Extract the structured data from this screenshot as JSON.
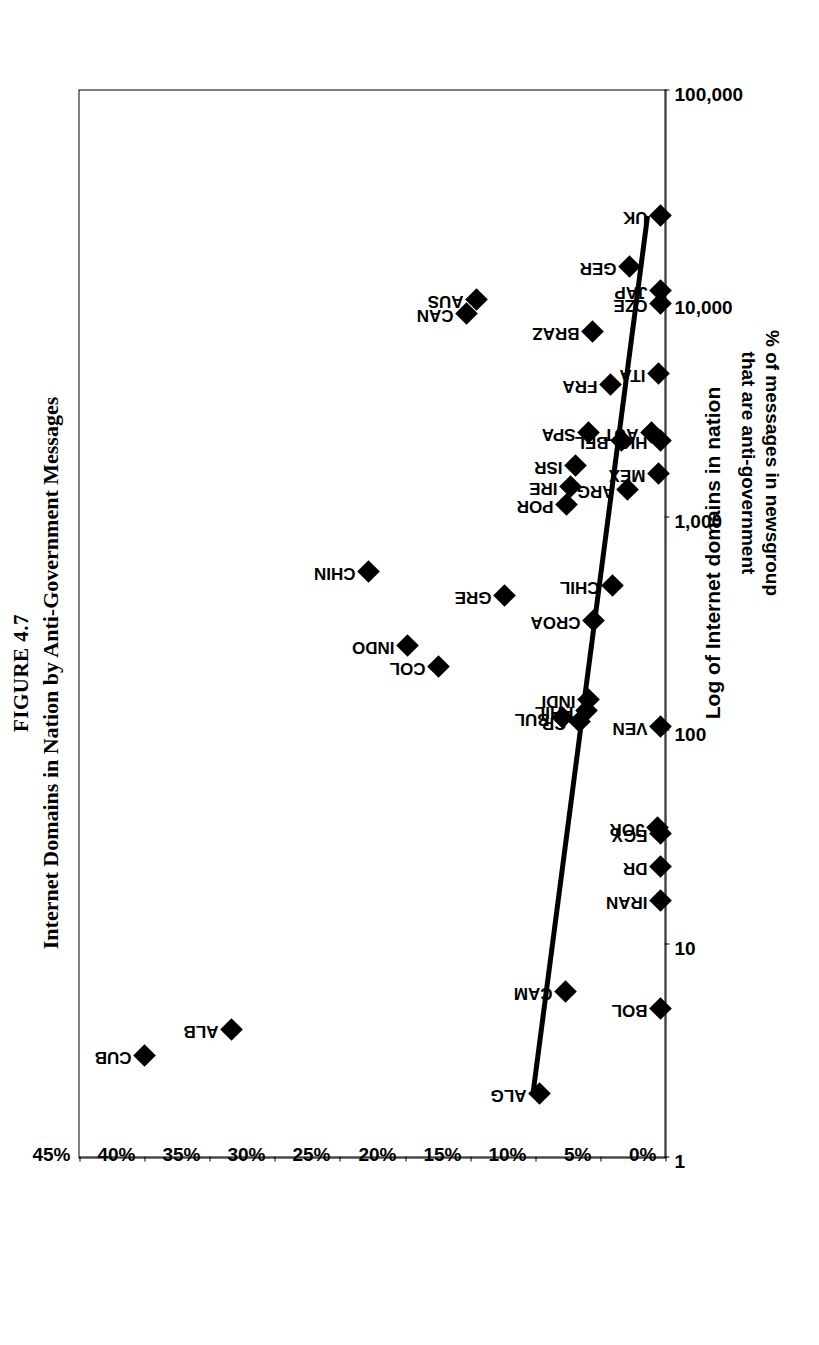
{
  "figure": {
    "number": "FIGURE 4.7",
    "title": "Internet Domains in Nation by Anti-Government Messages"
  },
  "axes": {
    "x_caption": "Log of Internet domains in nation",
    "y_caption_line1": "% of messages in newsgroup",
    "y_caption_line2": "that are anti-government",
    "x_ticks": [
      "1",
      "10",
      "100",
      "1,000",
      "10,000",
      "100,000"
    ],
    "y_ticks": [
      "0%",
      "5%",
      "10%",
      "15%",
      "20%",
      "25%",
      "30%",
      "35%",
      "40%",
      "45%"
    ]
  },
  "chart_data": {
    "type": "scatter",
    "title": "Internet Domains in Nation by Anti-Government Messages",
    "xlabel": "Log of Internet domains in nation",
    "ylabel": "% of messages in newsgroup that are anti-government",
    "xscale": "log",
    "xlim": [
      1,
      100000
    ],
    "ylim": [
      0,
      45
    ],
    "xticks": [
      1,
      10,
      100,
      1000,
      10000,
      100000
    ],
    "xticklabels": [
      "1",
      "10",
      "100",
      "1,000",
      "10,000",
      "100,000"
    ],
    "yticks": [
      0,
      5,
      10,
      15,
      20,
      25,
      30,
      35,
      40,
      45
    ],
    "yticklabels": [
      "0%",
      "5%",
      "10%",
      "15%",
      "20%",
      "25%",
      "30%",
      "35%",
      "40%",
      "45%"
    ],
    "grid": false,
    "legend": false,
    "point_labels_shown": true,
    "trendline": {
      "type": "linear-on-log-x",
      "x_start": 2.0,
      "y_start": 10.2,
      "x_end": 26000,
      "y_end": 1.4
    },
    "points": [
      {
        "label": "CUB",
        "x": 3,
        "y": 40.0
      },
      {
        "label": "ALB",
        "x": 4,
        "y": 33.3
      },
      {
        "label": "CHIN",
        "x": 560,
        "y": 22.8
      },
      {
        "label": "INDO",
        "x": 250,
        "y": 19.8
      },
      {
        "label": "COL",
        "x": 200,
        "y": 17.4
      },
      {
        "label": "CAN",
        "x": 9000,
        "y": 15.3
      },
      {
        "label": "AUS",
        "x": 10500,
        "y": 14.5
      },
      {
        "label": "GRE",
        "x": 430,
        "y": 12.4
      },
      {
        "label": "ALG",
        "x": 2,
        "y": 9.7
      },
      {
        "label": "BUL",
        "x": 115,
        "y": 7.9
      },
      {
        "label": "CAM",
        "x": 6,
        "y": 7.7
      },
      {
        "label": "POR",
        "x": 1150,
        "y": 7.6
      },
      {
        "label": "IRE",
        "x": 1400,
        "y": 7.3
      },
      {
        "label": "ISR",
        "x": 1750,
        "y": 6.9
      },
      {
        "label": "CR",
        "x": 110,
        "y": 6.6
      },
      {
        "label": "PHIL",
        "x": 125,
        "y": 6.1
      },
      {
        "label": "INDI",
        "x": 140,
        "y": 5.9
      },
      {
        "label": "SPA",
        "x": 2500,
        "y": 5.9
      },
      {
        "label": "BRAZ",
        "x": 7400,
        "y": 5.6
      },
      {
        "label": "CROA",
        "x": 330,
        "y": 5.5
      },
      {
        "label": "CHIL",
        "x": 480,
        "y": 4.1
      },
      {
        "label": "FRA",
        "x": 4200,
        "y": 4.2
      },
      {
        "label": "BEL",
        "x": 2300,
        "y": 3.4
      },
      {
        "label": "ARG",
        "x": 1350,
        "y": 2.9
      },
      {
        "label": "GER",
        "x": 15000,
        "y": 2.8
      },
      {
        "label": "BOL",
        "x": 5,
        "y": 0.4
      },
      {
        "label": "IRAN",
        "x": 16,
        "y": 0.4
      },
      {
        "label": "DR",
        "x": 23,
        "y": 0.4
      },
      {
        "label": "EGY",
        "x": 33,
        "y": 0.4
      },
      {
        "label": "JOR",
        "x": 35,
        "y": 0.6
      },
      {
        "label": "VEN",
        "x": 105,
        "y": 0.4
      },
      {
        "label": "MEX",
        "x": 1600,
        "y": 0.5
      },
      {
        "label": "HK",
        "x": 2300,
        "y": 0.4
      },
      {
        "label": "AUT",
        "x": 2500,
        "y": 1.1
      },
      {
        "label": "ITA",
        "x": 4700,
        "y": 0.5
      },
      {
        "label": "CZE",
        "x": 10000,
        "y": 0.4
      },
      {
        "label": "JAP",
        "x": 11500,
        "y": 0.4
      },
      {
        "label": "UK",
        "x": 26000,
        "y": 0.4
      }
    ]
  }
}
